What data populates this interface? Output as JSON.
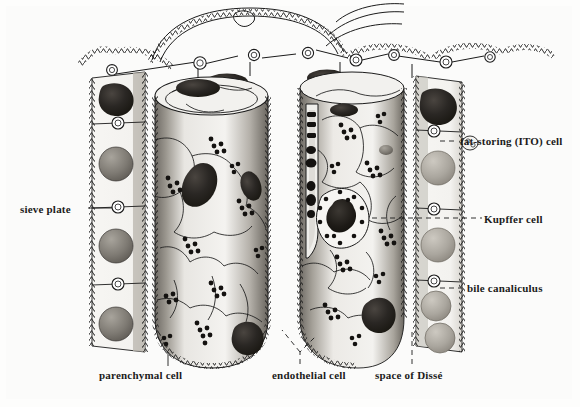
{
  "figure": {
    "background_color": "#fdfdfc",
    "ink_color": "#1b1b1b"
  },
  "labels": {
    "sieve_plate": "sieve plate",
    "fat_storing_ito_cell": "fat-storing (ITO) cell",
    "kupffer_cell": "Kupffer cell",
    "bile_canaliculus": "bile canaliculus",
    "parenchymal_cell": "parenchymal cell",
    "endothelial_cell": "endothelial cell",
    "space_of_disse": "space of Dissé"
  },
  "structures": {
    "sinusoid_lumen": "central sinusoid lumen",
    "hepatocyte_plate_left": "left hepatocyte plate",
    "hepatocyte_plate_right": "right hepatocyte plate",
    "glycogen_granules": "glycogen granule clusters",
    "endothelial_nuclei": "endothelial cell nuclei",
    "fenestrae_rings": "sieve plate fenestrae rings",
    "reticulin_network": "reticulin fiber network"
  },
  "colors": {
    "paper": "#fbfbfa",
    "ink": "#1b1b1b",
    "shade_mid": "#8e8b85",
    "shade_dark": "#3a3733",
    "nucleus_dark": "#262320",
    "nucleus_mid": "#6d6862"
  }
}
